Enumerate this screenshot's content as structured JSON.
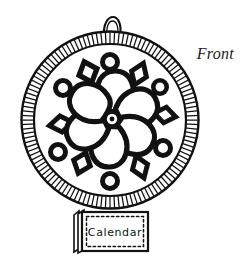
{
  "illustration": {
    "title": "Jeweled disc ornament, front view",
    "view_label": "Front",
    "tag_label": "Calendar",
    "colors": {
      "ink": "#111111",
      "background": "#ffffff",
      "shade": "#2b2b2b"
    },
    "parts": {
      "hanger_loop": "hanger-loop",
      "rim": "hatched-rim",
      "face": "disc-face",
      "flower": "six-petal-flower",
      "flower_center": "center-gem",
      "tag": "calendar-tag"
    },
    "geometry": {
      "disc_center_x": 110,
      "disc_center_y": 120,
      "disc_outer_radius": 89,
      "disc_inner_radius": 76,
      "petal_count": 6,
      "flower_center_x": 112,
      "flower_center_y": 119,
      "flower_radius": 44
    },
    "gems": [
      {
        "name": "round-gem-top",
        "shape": "round",
        "cx": 110,
        "cy": 62,
        "r": 10
      },
      {
        "name": "diamond-gem-upper-left",
        "shape": "diamond",
        "cx": 88,
        "cy": 72,
        "rx": 13,
        "ry": 15,
        "rot": -20
      },
      {
        "name": "diamond-gem-upper-right",
        "shape": "diamond",
        "cx": 139,
        "cy": 74,
        "rx": 11,
        "ry": 16,
        "rot": 22
      },
      {
        "name": "round-gem-left-upper",
        "shape": "round",
        "cx": 63,
        "cy": 88,
        "r": 10
      },
      {
        "name": "round-gem-right-upper",
        "shape": "round",
        "cx": 160,
        "cy": 87,
        "r": 9
      },
      {
        "name": "diamond-gem-left",
        "shape": "diamond",
        "cx": 61,
        "cy": 124,
        "rx": 16,
        "ry": 11,
        "rot": -8
      },
      {
        "name": "diamond-gem-right",
        "shape": "diamond",
        "cx": 165,
        "cy": 115,
        "rx": 15,
        "ry": 11,
        "rot": 10
      },
      {
        "name": "round-gem-left-lower",
        "shape": "round",
        "cx": 58,
        "cy": 152,
        "r": 10
      },
      {
        "name": "round-gem-right-lower",
        "shape": "round",
        "cx": 163,
        "cy": 148,
        "r": 10
      },
      {
        "name": "diamond-gem-lower-left",
        "shape": "diamond",
        "cx": 82,
        "cy": 163,
        "rx": 12,
        "ry": 15,
        "rot": 20
      },
      {
        "name": "diamond-gem-lower-right",
        "shape": "diamond",
        "cx": 140,
        "cy": 167,
        "rx": 11,
        "ry": 16,
        "rot": -20
      },
      {
        "name": "round-gem-bottom",
        "shape": "round",
        "cx": 110,
        "cy": 181,
        "r": 10
      }
    ],
    "rim_hatch_count": 120
  }
}
